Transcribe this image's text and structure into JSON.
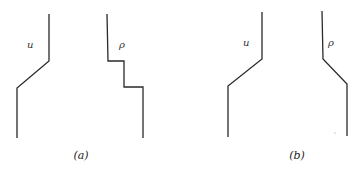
{
  "panels": [
    {
      "caption": "(a)",
      "curves": [
        {
          "label": "u",
          "shape": "step up via linear ramp"
        },
        {
          "label": "ρ",
          "shape": "two-step staircase"
        }
      ]
    },
    {
      "caption": "(b)",
      "curves": [
        {
          "label": "u",
          "shape": "step up via linear ramp"
        },
        {
          "label": "ρ",
          "shape": "step down via linear ramp"
        }
      ]
    }
  ],
  "colors": {
    "line": "#2a2a2a",
    "background": "#ffffff"
  }
}
